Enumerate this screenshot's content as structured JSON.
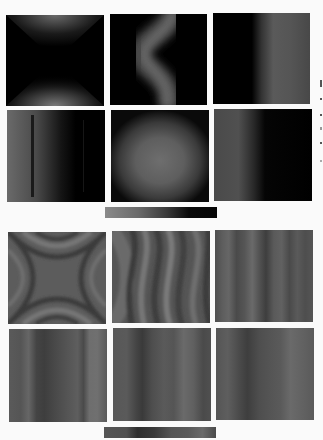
{
  "figure": {
    "background": "#fafafa",
    "top_group": {
      "description": "Intensity maps (dark background)",
      "panels": [
        {
          "id": "t1",
          "pattern": "x-shaped-hourglass",
          "x": 6,
          "y": 15,
          "w": 98,
          "h": 91
        },
        {
          "id": "t2",
          "pattern": "s-wave-ridge",
          "x": 110,
          "y": 14,
          "w": 97,
          "h": 91
        },
        {
          "id": "t3",
          "pattern": "right-vertical-bright-band",
          "x": 213,
          "y": 13,
          "w": 97,
          "h": 91
        },
        {
          "id": "t4",
          "pattern": "left-gradient-with-line",
          "x": 7,
          "y": 110,
          "w": 98,
          "h": 92
        },
        {
          "id": "t5",
          "pattern": "central-bright-disc",
          "x": 111,
          "y": 110,
          "w": 98,
          "h": 92
        },
        {
          "id": "t6",
          "pattern": "left-gradient",
          "x": 214,
          "y": 109,
          "w": 98,
          "h": 92
        }
      ],
      "colorbar": {
        "x": 105,
        "y": 207,
        "w": 112,
        "h": 11,
        "from": "#8a8a8a",
        "to": "#050505"
      }
    },
    "bottom_group": {
      "description": "Phase/fringe maps (gray)",
      "panels": [
        {
          "id": "b1",
          "pattern": "astroid-fringes",
          "x": 8,
          "y": 232,
          "w": 98,
          "h": 92
        },
        {
          "id": "b2",
          "pattern": "wavy-fringes",
          "x": 112,
          "y": 231,
          "w": 98,
          "h": 92
        },
        {
          "id": "b3",
          "pattern": "vertical-stripes",
          "x": 215,
          "y": 230,
          "w": 98,
          "h": 92
        },
        {
          "id": "b4",
          "pattern": "vertical-stripes",
          "x": 9,
          "y": 329,
          "w": 98,
          "h": 93
        },
        {
          "id": "b5",
          "pattern": "vertical-stripes",
          "x": 113,
          "y": 328,
          "w": 98,
          "h": 93
        },
        {
          "id": "b6",
          "pattern": "vertical-stripes",
          "x": 216,
          "y": 328,
          "w": 98,
          "h": 92
        }
      ],
      "colorbar": {
        "x": 104,
        "y": 427,
        "w": 112,
        "h": 11
      }
    },
    "edge_marks": [
      {
        "x": 320,
        "y": 80,
        "w": 2,
        "h": 7
      },
      {
        "x": 320,
        "y": 98,
        "w": 2,
        "h": 2
      },
      {
        "x": 320,
        "y": 114,
        "w": 2,
        "h": 2
      },
      {
        "x": 320,
        "y": 127,
        "w": 2,
        "h": 3
      },
      {
        "x": 320,
        "y": 142,
        "w": 2,
        "h": 2
      },
      {
        "x": 320,
        "y": 160,
        "w": 2,
        "h": 2
      }
    ]
  }
}
